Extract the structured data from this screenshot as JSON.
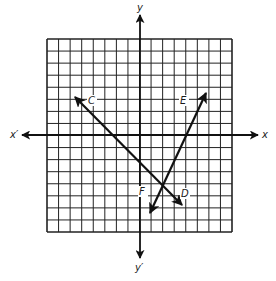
{
  "diagram": {
    "type": "coordinate-grid-with-vectors",
    "grid": {
      "columns": 16,
      "rows": 16,
      "left": 47,
      "top": 39,
      "right": 232,
      "bottom": 232,
      "line_color": "#222222"
    },
    "axes": {
      "x_positive_label": "x",
      "x_negative_label": "x′",
      "y_positive_label": "y",
      "y_negative_label": "y′",
      "color": "#111111"
    },
    "lines": [
      {
        "name": "C-D",
        "end_labels": [
          "C",
          "D"
        ],
        "from": {
          "x": 75,
          "y": 97
        },
        "to": {
          "x": 182,
          "y": 205
        },
        "arrow_at_start": true,
        "arrow_at_end": true
      },
      {
        "name": "E-F",
        "end_labels": [
          "E",
          "F"
        ],
        "from": {
          "x": 206,
          "y": 93
        },
        "to": {
          "x": 150,
          "y": 213
        },
        "arrow_at_start": true,
        "arrow_at_end": true
      }
    ],
    "point_labels": [
      {
        "text": "C",
        "x": 91,
        "y": 104
      },
      {
        "text": "E",
        "x": 183,
        "y": 104
      },
      {
        "text": "F",
        "x": 142,
        "y": 195
      },
      {
        "text": "D",
        "x": 184,
        "y": 197
      }
    ]
  }
}
